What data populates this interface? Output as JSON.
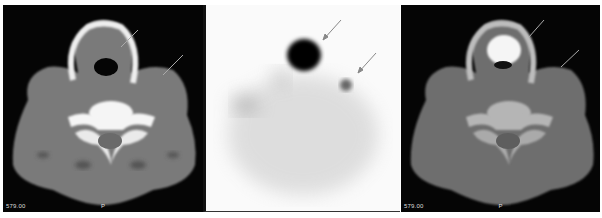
{
  "figure": {
    "panels": [
      {
        "id": "ct-axial",
        "type": "CT axial neck slice",
        "label_left": "579.00",
        "label_center": "P",
        "arrows": 2
      },
      {
        "id": "spect-axial",
        "type": "SPECT axial slice (inverted grayscale)",
        "arrows": 2
      },
      {
        "id": "fused-axial",
        "type": "SPECT/CT fused axial slice",
        "label_left": "579.00",
        "label_center": "P",
        "arrows": 2
      }
    ],
    "colors": {
      "ct_background": "#050505",
      "spect_background": "#fafafa",
      "bone": "#f2f2f2",
      "soft_tissue": "#7a7a7a",
      "hot_spot": "#050505",
      "arrow": "#9a9a9a"
    }
  }
}
